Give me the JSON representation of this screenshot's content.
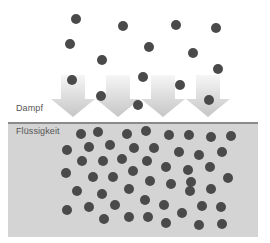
{
  "labels": {
    "vapor": "Dampf",
    "liquid": "Flüssigkeit"
  },
  "colors": {
    "molecule": "#4a4a4a",
    "liquid_fill": "#d4d4d4",
    "surface_line": "#8a8a8a",
    "arrow_top": "#f4f4f4",
    "arrow_bottom": "#c8c8c8",
    "label_text": "#555555"
  },
  "arrows": [
    {
      "cx": 73,
      "top": 75,
      "bottom": 117
    },
    {
      "cx": 118,
      "top": 75,
      "bottom": 117
    },
    {
      "cx": 163,
      "top": 75,
      "bottom": 117
    },
    {
      "cx": 208,
      "top": 75,
      "bottom": 117
    }
  ],
  "vapor_molecules": [
    [
      76,
      19
    ],
    [
      123,
      26
    ],
    [
      176,
      25
    ],
    [
      216,
      28
    ],
    [
      70,
      44
    ],
    [
      149,
      47
    ],
    [
      193,
      53
    ],
    [
      102,
      60
    ],
    [
      218,
      69
    ],
    [
      72,
      80
    ],
    [
      143,
      77
    ],
    [
      180,
      85
    ],
    [
      101,
      96
    ],
    [
      209,
      100
    ],
    [
      138,
      105
    ]
  ],
  "liquid_molecules": [
    [
      81,
      134
    ],
    [
      98,
      132
    ],
    [
      127,
      134
    ],
    [
      146,
      131
    ],
    [
      169,
      135
    ],
    [
      189,
      135
    ],
    [
      211,
      137
    ],
    [
      231,
      136
    ],
    [
      67,
      150
    ],
    [
      89,
      147
    ],
    [
      110,
      145
    ],
    [
      134,
      148
    ],
    [
      154,
      148
    ],
    [
      179,
      152
    ],
    [
      199,
      155
    ],
    [
      222,
      152
    ],
    [
      82,
      161
    ],
    [
      103,
      161
    ],
    [
      122,
      159
    ],
    [
      147,
      161
    ],
    [
      166,
      167
    ],
    [
      188,
      170
    ],
    [
      210,
      167
    ],
    [
      66,
      173
    ],
    [
      93,
      177
    ],
    [
      113,
      177
    ],
    [
      133,
      171
    ],
    [
      150,
      181
    ],
    [
      171,
      184
    ],
    [
      191,
      182
    ],
    [
      228,
      178
    ],
    [
      77,
      191
    ],
    [
      102,
      194
    ],
    [
      129,
      189
    ],
    [
      190,
      191
    ],
    [
      211,
      189
    ],
    [
      145,
      200
    ],
    [
      115,
      205
    ],
    [
      164,
      205
    ],
    [
      202,
      206
    ],
    [
      221,
      207
    ],
    [
      67,
      210
    ],
    [
      89,
      207
    ],
    [
      182,
      213
    ],
    [
      104,
      219
    ],
    [
      129,
      217
    ],
    [
      148,
      217
    ],
    [
      166,
      223
    ],
    [
      199,
      225
    ],
    [
      222,
      224
    ]
  ],
  "molecule_radius": 5
}
